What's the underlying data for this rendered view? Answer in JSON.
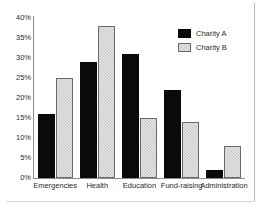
{
  "chart_data": {
    "type": "bar",
    "title": "",
    "xlabel": "",
    "ylabel": "",
    "categories": [
      "Emergencies",
      "Health",
      "Education",
      "Fund-raising",
      "Administration"
    ],
    "series": [
      {
        "name": "Charity A",
        "color": "#0a0a0a",
        "values": [
          16,
          29,
          31,
          22,
          2
        ]
      },
      {
        "name": "Charity B",
        "color": "#c8c8c8",
        "values": [
          25,
          38,
          15,
          14,
          8
        ]
      }
    ],
    "ylim": [
      0,
      40
    ],
    "ytick_labels": [
      "40%",
      "35%",
      "30%",
      "25%",
      "20%",
      "15%",
      "10%",
      "5%",
      "0%"
    ],
    "ytick_values": [
      40,
      35,
      30,
      25,
      20,
      15,
      10,
      5,
      0
    ],
    "grid": false,
    "legend_position": "top-right",
    "value_suffix": "%"
  },
  "legend": {
    "items": [
      {
        "label": "Charity A"
      },
      {
        "label": "Charity B"
      }
    ]
  },
  "artifacts": {
    "top_crop_mark": ". ."
  }
}
